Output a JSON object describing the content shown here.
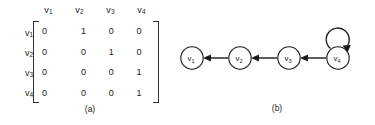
{
  "figure": {
    "panel_a": {
      "caption": "(a)",
      "column_headers": [
        "v1",
        "v2",
        "v3",
        "v4"
      ],
      "row_labels": [
        "v1",
        "v2",
        "v3",
        "v4"
      ],
      "matrix": [
        [
          "0",
          "1",
          "0",
          "0"
        ],
        [
          "0",
          "0",
          "1",
          "0"
        ],
        [
          "0",
          "0",
          "0",
          "1"
        ],
        [
          "0",
          "0",
          "0",
          "1"
        ]
      ]
    },
    "panel_b": {
      "caption": "(b)",
      "nodes": [
        {
          "id": "v1",
          "base": "v",
          "sub": "1",
          "cx": 12,
          "cy": 58
        },
        {
          "id": "v2",
          "base": "v",
          "sub": "2",
          "cx": 60,
          "cy": 58
        },
        {
          "id": "v3",
          "base": "v",
          "sub": "3",
          "cx": 109,
          "cy": 58
        },
        {
          "id": "v4",
          "base": "v",
          "sub": "4",
          "cx": 158,
          "cy": 58
        }
      ],
      "edges": [
        {
          "from": "v2",
          "to": "v1",
          "label": "edge-v2-v1"
        },
        {
          "from": "v3",
          "to": "v2",
          "label": "edge-v3-v2"
        },
        {
          "from": "v4",
          "to": "v3",
          "label": "edge-v4-v3"
        },
        {
          "from": "v4",
          "to": "v4",
          "label": "self-loop-v4"
        }
      ]
    }
  },
  "chart_data": {
    "type": "diagram",
    "title": "",
    "subtitle": "",
    "panels": [
      {
        "label": "(a)",
        "kind": "table",
        "description": "adjacency matrix",
        "categories": [
          "v1",
          "v2",
          "v3",
          "v4"
        ],
        "rows": [
          "v1",
          "v2",
          "v3",
          "v4"
        ],
        "values": [
          [
            0,
            1,
            0,
            0
          ],
          [
            0,
            0,
            1,
            0
          ],
          [
            0,
            0,
            0,
            1
          ],
          [
            0,
            0,
            0,
            1
          ]
        ]
      },
      {
        "label": "(b)",
        "kind": "graph",
        "description": "directed graph",
        "nodes": [
          "v1",
          "v2",
          "v3",
          "v4"
        ],
        "directed_edges": [
          [
            "v2",
            "v1"
          ],
          [
            "v3",
            "v2"
          ],
          [
            "v4",
            "v3"
          ],
          [
            "v4",
            "v4"
          ]
        ]
      }
    ]
  },
  "colors": {
    "background": "#ffffff",
    "ink": "#1a1a1a",
    "text": "#222222"
  }
}
